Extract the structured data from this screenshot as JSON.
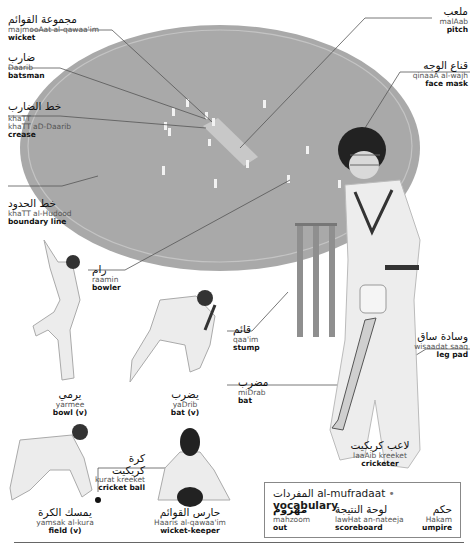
{
  "colors": {
    "field": "#a9a9a9",
    "field_edge": "#c4c4c4",
    "pitch": "#c8c8c8",
    "leader": "#555555",
    "text": "#111111",
    "translit": "#555555"
  },
  "labels": {
    "wicket": {
      "arabic": "مجموعة القوائم",
      "translit": "majmooAat al-qawaa'im",
      "english": "wicket"
    },
    "batsman": {
      "arabic": "ضارب",
      "translit": "Daarib",
      "english": "batsman"
    },
    "crease": {
      "arabic": "خط الضارب",
      "translit": "khaTT aD-Daarib",
      "english": "crease"
    },
    "boundary_line": {
      "arabic": "خط الحدود",
      "translit": "khaTT al-Hudood",
      "english": "boundary line"
    },
    "pitch": {
      "arabic": "ملعب",
      "translit": "malAab",
      "english": "pitch"
    },
    "face_mask": {
      "arabic": "قناع الوجه",
      "translit": "qinaaA al-wajh",
      "english": "face mask"
    },
    "bowler": {
      "arabic": "رام",
      "translit": "raamin",
      "english": "bowler"
    },
    "stump": {
      "arabic": "قائم",
      "translit": "qaa'im",
      "english": "stump"
    },
    "bat_noun": {
      "arabic": "مضرب",
      "translit": "miDrab",
      "english": "bat"
    },
    "leg_pad": {
      "arabic": "وسادة ساق",
      "translit": "wisaadat saaq",
      "english": "leg pad"
    },
    "bowl_v": {
      "arabic": "يرمي",
      "translit": "yarmee",
      "english": "bowl (v)"
    },
    "bat_v": {
      "arabic": "يضرب",
      "translit": "yaDrib",
      "english": "bat (v)"
    },
    "cricket_ball": {
      "arabic": "كرة كريكيت",
      "translit": "kurat kreeket",
      "english": "cricket ball"
    },
    "field_v": {
      "arabic": "يمسك الكرة",
      "translit": "yamsak al-kura",
      "english": "field (v)"
    },
    "wicket_keeper": {
      "arabic": "حارس القوائم",
      "translit": "Haaris al-qawaa'im",
      "english": "wicket-keeper"
    },
    "cricketer": {
      "arabic": "لاعب كريكيت",
      "translit": "laaAib kreeket",
      "english": "cricketer"
    }
  },
  "vocabulary": {
    "title_arabic": "المفردات",
    "title_translit": "al-mufradaat",
    "separator": "•",
    "title_english": "vocabulary",
    "items": [
      {
        "arabic": "مهزوم",
        "translit": "mahzoom",
        "english": "out"
      },
      {
        "arabic": "لوحة النتيجة",
        "translit": "lawHat an-nateeja",
        "english": "scoreboard"
      },
      {
        "arabic": "حكم",
        "translit": "Hakam",
        "english": "umpire"
      }
    ]
  }
}
